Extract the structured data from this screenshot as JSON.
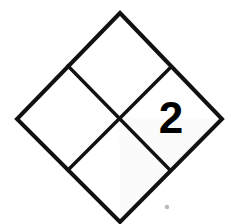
{
  "placard": {
    "type": "nfpa-704-fire-diamond",
    "title": "NFPA 704 hazard diamond",
    "outline_color": "#111111",
    "background_color": "#ffffff",
    "geometry": {
      "top_vertex": [
        120,
        13
      ],
      "right_vertex": [
        222,
        119
      ],
      "bottom_vertex": [
        120,
        222
      ],
      "left_vertex": [
        17,
        119
      ],
      "center": [
        119,
        118
      ]
    },
    "quadrants": [
      {
        "id": "health",
        "position": "left",
        "label": "",
        "fill": "#ffffff",
        "text_x": 68,
        "text_y": 118
      },
      {
        "id": "flammability",
        "position": "top",
        "label": "",
        "fill": "#ffffff",
        "text_x": 120,
        "text_y": 66
      },
      {
        "id": "instability",
        "position": "right",
        "label": "2",
        "fill": "#fbfbfb",
        "text_x": 171,
        "text_y": 121
      },
      {
        "id": "special",
        "position": "bottom",
        "label": "",
        "fill": "#ffffff",
        "text_x": 120,
        "text_y": 171
      }
    ],
    "artifacts": {
      "speck": {
        "x": 167,
        "y": 207,
        "r": 2.2
      }
    }
  }
}
